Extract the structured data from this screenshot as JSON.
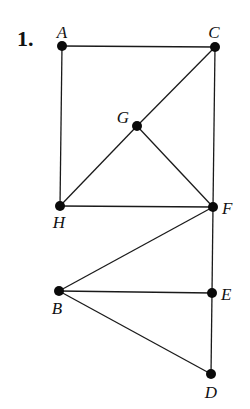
{
  "problem_number": "1.",
  "graph": {
    "nodes": [
      {
        "id": "A",
        "label": "A",
        "x": 62,
        "y": 46,
        "lx": 62,
        "ly": 38,
        "anchor": "middle"
      },
      {
        "id": "C",
        "label": "C",
        "x": 215,
        "y": 47,
        "lx": 214,
        "ly": 38,
        "anchor": "middle"
      },
      {
        "id": "G",
        "label": "G",
        "x": 137,
        "y": 126,
        "lx": 123,
        "ly": 123,
        "anchor": "middle"
      },
      {
        "id": "H",
        "label": "H",
        "x": 60,
        "y": 206,
        "lx": 59,
        "ly": 228,
        "anchor": "middle"
      },
      {
        "id": "F",
        "label": "F",
        "x": 213,
        "y": 207,
        "lx": 222,
        "ly": 214,
        "anchor": "start"
      },
      {
        "id": "B",
        "label": "B",
        "x": 59,
        "y": 291,
        "lx": 57,
        "ly": 314,
        "anchor": "middle"
      },
      {
        "id": "E",
        "label": "E",
        "x": 212,
        "y": 293,
        "lx": 221,
        "ly": 300,
        "anchor": "start"
      },
      {
        "id": "D",
        "label": "D",
        "x": 211,
        "y": 374,
        "lx": 211,
        "ly": 398,
        "anchor": "middle"
      }
    ],
    "edges": [
      [
        "A",
        "C"
      ],
      [
        "A",
        "H"
      ],
      [
        "C",
        "G"
      ],
      [
        "C",
        "F"
      ],
      [
        "G",
        "H"
      ],
      [
        "G",
        "F"
      ],
      [
        "H",
        "F"
      ],
      [
        "F",
        "B"
      ],
      [
        "F",
        "E"
      ],
      [
        "B",
        "E"
      ],
      [
        "B",
        "D"
      ],
      [
        "E",
        "D"
      ]
    ],
    "node_radius": 5,
    "colors": {
      "edge": "#1a1a1a",
      "node": "#0a0a0a",
      "label": "#111111"
    }
  }
}
